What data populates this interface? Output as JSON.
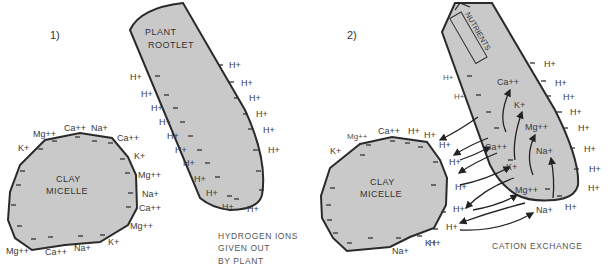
{
  "panel1": {
    "number": "1)",
    "rootlet": {
      "line1": "PLANT",
      "line2": "ROOTLET"
    },
    "micelle": {
      "line1": "CLAY",
      "line2": "MICELLE"
    },
    "micelle_ions": [
      "Mg++",
      "Ca++",
      "Na+",
      "Ca++",
      "K+",
      "Mg++",
      "Na+",
      "Ca++",
      "Mg++",
      "K+",
      "Na+",
      "Ca++",
      "Mg++",
      "K+"
    ],
    "rootlet_ions": [
      "H+",
      "H+",
      "H+",
      "H+",
      "H+",
      "H+",
      "H+",
      "H+",
      "H+",
      "H+",
      "H+",
      "H+",
      "H+",
      "H+",
      "H+",
      "H+",
      "H+"
    ],
    "caption": {
      "line1": "HYDROGEN IONS",
      "line2": "GIVEN OUT",
      "line3": "BY PLANT"
    }
  },
  "panel2": {
    "number": "2)",
    "rootlet_label": "NUTRIENTS",
    "micelle": {
      "line1": "CLAY",
      "line2": "MICELLE"
    },
    "micelle_ions": [
      "Mg++",
      "Ca++",
      "H+",
      "H+",
      "H+",
      "H+",
      "H+",
      "H+",
      "H+",
      "H+",
      "K+",
      "Na+",
      "K+"
    ],
    "exchange_ions": [
      "Ca++",
      "K+",
      "Mg++",
      "Na+"
    ],
    "absorbed_ions": [
      "Ca++",
      "K+",
      "Mg++",
      "Na+"
    ],
    "rootlet_ions": [
      "H+",
      "H+",
      "H+",
      "H+",
      "H+",
      "H+",
      "H+",
      "H+",
      "H+",
      "H+",
      "H+"
    ],
    "caption": "CATION EXCHANGE"
  },
  "colors": {
    "fill": "#c9c9c9",
    "stroke": "#2a2a2a",
    "text": "#333333",
    "background": "#ffffff"
  }
}
